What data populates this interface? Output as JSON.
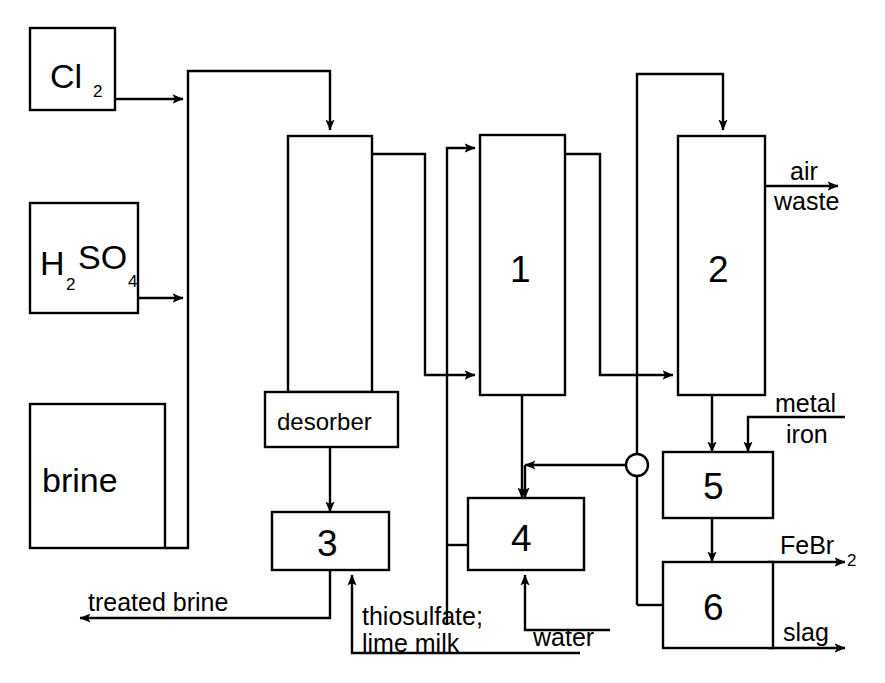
{
  "diagram": {
    "background_color": "#ffffff",
    "line_color": "#000000"
  },
  "feed_boxes": [
    {
      "id": "chlorine",
      "label": "Cl",
      "sub": "2",
      "name": "chlorine-feed-box"
    },
    {
      "id": "sulfuric_acid",
      "label": "H",
      "sub": "2",
      "label2": "SO",
      "sub2": "4",
      "name": "sulfuric-acid-feed-box"
    },
    {
      "id": "brine",
      "label": "brine",
      "name": "brine-feed-box"
    }
  ],
  "units": {
    "absorber_column": {
      "label": ""
    },
    "desorber": {
      "label": "desorber"
    },
    "unit1": {
      "label": "1"
    },
    "unit2": {
      "label": "2"
    },
    "unit3": {
      "label": "3"
    },
    "unit4": {
      "label": "4"
    },
    "unit5": {
      "label": "5"
    },
    "unit6": {
      "label": "6"
    }
  },
  "streams": {
    "air": "air",
    "waste": "waste",
    "metal": "metal",
    "iron": "iron",
    "febr2_main": "FeBr",
    "febr2_sub": "2",
    "slag": "slag",
    "treated_brine": "treated brine",
    "thiosulfate": "thiosulfate;",
    "lime_milk": "lime milk",
    "water": "water"
  }
}
